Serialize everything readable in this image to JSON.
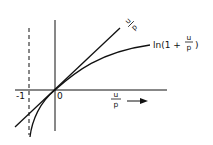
{
  "diagram": {
    "type": "function-comparison-plot",
    "curves": [
      {
        "name": "line",
        "label_num": "u",
        "label_den": "p",
        "expression": "u/p"
      },
      {
        "name": "log-curve",
        "label_prefix": "ln(1 + ",
        "label_num": "u",
        "label_den": "p",
        "label_suffix": ")",
        "expression": "ln(1 + u/p)"
      }
    ],
    "x_axis": {
      "label_num": "u",
      "label_den": "p",
      "arrow": "→"
    },
    "ticks": {
      "minus_one": "-1",
      "origin": "0"
    },
    "asymptote": {
      "x": "-1",
      "style": "dashed"
    },
    "colors": {
      "stroke": "#111111",
      "background": "#ffffff"
    }
  }
}
